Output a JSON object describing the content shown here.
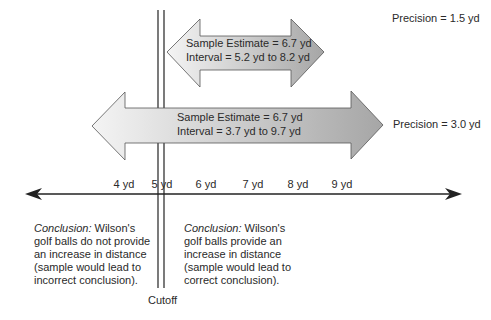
{
  "top_interval": {
    "estimate": "Sample Estimate = 6.7 yd",
    "interval": "Interval = 5.2 yd to 8.2 yd",
    "precision": "Precision = 1.5 yd"
  },
  "bottom_interval": {
    "estimate": "Sample Estimate = 6.7 yd",
    "interval": "Interval = 3.7 yd to 9.7 yd",
    "precision": "Precision = 3.0 yd"
  },
  "axis": {
    "ticks": [
      "4 yd",
      "5 yd",
      "6 yd",
      "7 yd",
      "8 yd",
      "9 yd"
    ]
  },
  "cutoff": {
    "label": "Cutoff"
  },
  "conclusions": {
    "left": {
      "lead": "Conclusion:",
      "text": "Wilson's golf balls do not provide an increase in distance (sample would lead to incorrect conclusion)."
    },
    "right": {
      "lead": "Conclusion:",
      "text": "Wilson's golf balls provide an increase in distance (sample would lead to correct conclusion)."
    }
  },
  "colors": {
    "arrow_light": "#f2f2f2",
    "arrow_dark": "#a9a9a9",
    "outline": "#555555",
    "axis": "#222222"
  }
}
